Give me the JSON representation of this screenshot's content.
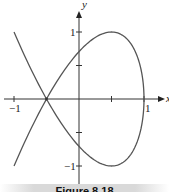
{
  "caption": "Figure 8.18",
  "chart_data": {
    "type": "line",
    "title": "",
    "xlabel": "x",
    "ylabel": "y",
    "xlim": [
      -1.1,
      1.2
    ],
    "ylim": [
      -1.35,
      1.45
    ],
    "grid": false,
    "x_ticks": [
      -1,
      0.5,
      1
    ],
    "x_tick_labels": [
      "−1",
      "",
      "1"
    ],
    "y_ticks": [
      1,
      0.5,
      -0.5,
      -1
    ],
    "y_tick_labels": [
      "1",
      "",
      "",
      "−1"
    ],
    "series": [
      {
        "name": "parametric curve x = 1 − t², y = 2.12t − 1.414t³",
        "color": "#555555",
        "t_range": [
          -1.414,
          1.414
        ],
        "points": [
          {
            "x": -1.0,
            "y": 1.0
          },
          {
            "x": -0.5,
            "y": 0.0
          },
          {
            "x": 0.0,
            "y": 0.707
          },
          {
            "x": 0.5,
            "y": 1.0
          },
          {
            "x": 1.0,
            "y": 0.0
          },
          {
            "x": 0.5,
            "y": -1.0
          },
          {
            "x": 0.0,
            "y": -0.707
          },
          {
            "x": -0.5,
            "y": 0.0
          },
          {
            "x": -1.0,
            "y": -1.0
          }
        ]
      }
    ],
    "annotations": [
      {
        "text": "self-intersection",
        "x": -0.5,
        "y": 0
      }
    ]
  }
}
